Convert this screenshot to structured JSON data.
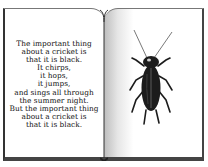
{
  "image": {
    "description": "Open book illustration: left page with a short poem, right page with a drawing of a black cricket",
    "left_page": {
      "poem_lines": [
        "The important thing",
        "about a cricket is",
        "that it is black.",
        "It chirps,",
        "it hops,",
        "it jumps,",
        "and sings all through",
        "the summer night.",
        "But the important thing",
        "about a cricket is",
        "that it is black."
      ]
    },
    "right_page": {
      "illustration": "cricket-insect",
      "colors": {
        "body": "#1c1c1c",
        "highlight": "#5a5a5a"
      }
    }
  }
}
